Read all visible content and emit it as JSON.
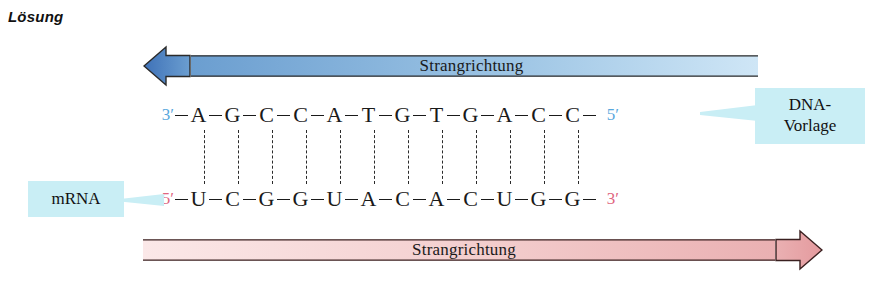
{
  "heading": "Lösung",
  "arrows": {
    "top": {
      "label": "Strangrichtung",
      "direction": "left",
      "color_head": "#4a7fc1",
      "color_tail": "#cfe4f5"
    },
    "bottom": {
      "label": "Strangrichtung",
      "direction": "right",
      "color_head": "#e8a0a4",
      "color_tail": "#fbe6e6"
    }
  },
  "strands": {
    "dna": {
      "left_end": "3′",
      "right_end": "5′",
      "end_color": "#59a8dd",
      "bases": [
        "A",
        "G",
        "C",
        "C",
        "A",
        "T",
        "G",
        "T",
        "G",
        "A",
        "C",
        "C"
      ]
    },
    "mrna": {
      "left_end": "5′",
      "right_end": "3′",
      "end_color": "#e0657f",
      "bases": [
        "U",
        "C",
        "G",
        "G",
        "U",
        "A",
        "C",
        "A",
        "C",
        "U",
        "G",
        "G"
      ]
    },
    "base_pair_count": 12
  },
  "callouts": {
    "mrna": {
      "label": "mRNA",
      "background": "#c9eef5"
    },
    "dna": {
      "line1": "DNA-",
      "line2": "Vorlage",
      "background": "#c9eef5"
    }
  }
}
